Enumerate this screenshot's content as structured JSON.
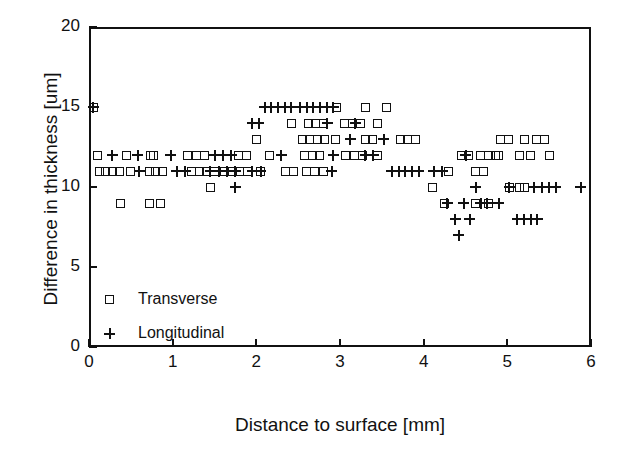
{
  "chart_data": {
    "type": "scatter",
    "title": "",
    "xlabel": "Distance to surface [mm]",
    "ylabel": "Difference in thickness [um]",
    "xlim": [
      0,
      6
    ],
    "ylim": [
      0,
      20
    ],
    "xticks": [
      0,
      1,
      2,
      3,
      4,
      5,
      6
    ],
    "yticks": [
      0,
      5,
      10,
      15,
      20
    ],
    "xtick_labels": [
      "0",
      "1",
      "2",
      "3",
      "4",
      "5",
      "6"
    ],
    "ytick_labels": [
      "0",
      "5",
      "10",
      "15",
      "20"
    ],
    "grid": false,
    "legend_position": "inside lower-left",
    "series": [
      {
        "name": "Transverse",
        "marker": "square",
        "color": "#111111",
        "points": [
          [
            0.05,
            15
          ],
          [
            0.1,
            12
          ],
          [
            0.45,
            12
          ],
          [
            0.73,
            12
          ],
          [
            0.77,
            12
          ],
          [
            1.18,
            12
          ],
          [
            1.28,
            12
          ],
          [
            1.38,
            12
          ],
          [
            1.79,
            12
          ],
          [
            1.88,
            12
          ],
          [
            2.16,
            12
          ],
          [
            2.57,
            12
          ],
          [
            2.67,
            12
          ],
          [
            2.76,
            12
          ],
          [
            3.07,
            12
          ],
          [
            3.17,
            12
          ],
          [
            3.27,
            12
          ],
          [
            3.45,
            12
          ],
          [
            0.12,
            11
          ],
          [
            0.2,
            11
          ],
          [
            0.28,
            11
          ],
          [
            0.36,
            11
          ],
          [
            0.5,
            11
          ],
          [
            0.72,
            11
          ],
          [
            0.8,
            11
          ],
          [
            0.88,
            11
          ],
          [
            1.23,
            11
          ],
          [
            1.32,
            11
          ],
          [
            1.41,
            11
          ],
          [
            1.5,
            11
          ],
          [
            1.62,
            11
          ],
          [
            1.71,
            11
          ],
          [
            1.8,
            11
          ],
          [
            1.89,
            11
          ],
          [
            2.05,
            11
          ],
          [
            2.35,
            11
          ],
          [
            2.44,
            11
          ],
          [
            2.6,
            11
          ],
          [
            2.7,
            11
          ],
          [
            2.8,
            11
          ],
          [
            1.45,
            10
          ],
          [
            0.38,
            9
          ],
          [
            0.72,
            9
          ],
          [
            0.85,
            9
          ],
          [
            2.96,
            15
          ],
          [
            3.3,
            15
          ],
          [
            3.55,
            15
          ],
          [
            2.42,
            14
          ],
          [
            2.62,
            14
          ],
          [
            2.71,
            14
          ],
          [
            2.8,
            14
          ],
          [
            3.05,
            14
          ],
          [
            3.15,
            14
          ],
          [
            3.24,
            14
          ],
          [
            3.45,
            14
          ],
          [
            2.0,
            13
          ],
          [
            2.55,
            13
          ],
          [
            2.64,
            13
          ],
          [
            2.73,
            13
          ],
          [
            2.82,
            13
          ],
          [
            2.95,
            13
          ],
          [
            3.3,
            13
          ],
          [
            3.39,
            13
          ],
          [
            3.72,
            13
          ],
          [
            3.81,
            13
          ],
          [
            3.9,
            13
          ],
          [
            4.45,
            12
          ],
          [
            4.54,
            12
          ],
          [
            4.68,
            12
          ],
          [
            4.77,
            12
          ],
          [
            4.86,
            12
          ],
          [
            4.92,
            13
          ],
          [
            5.01,
            13
          ],
          [
            5.2,
            13
          ],
          [
            5.35,
            13
          ],
          [
            5.44,
            13
          ],
          [
            4.9,
            12
          ],
          [
            5.15,
            12
          ],
          [
            5.28,
            12
          ],
          [
            5.5,
            12
          ],
          [
            4.3,
            11
          ],
          [
            4.62,
            11
          ],
          [
            4.71,
            11
          ],
          [
            4.25,
            9
          ],
          [
            4.62,
            9
          ],
          [
            4.78,
            9
          ],
          [
            5.02,
            10
          ],
          [
            5.14,
            10
          ],
          [
            5.2,
            10
          ],
          [
            4.1,
            10
          ]
        ]
      },
      {
        "name": "Longitudinal",
        "marker": "plus",
        "color": "#111111",
        "points": [
          [
            0.05,
            15
          ],
          [
            0.28,
            12
          ],
          [
            0.58,
            12
          ],
          [
            0.98,
            12
          ],
          [
            1.5,
            12
          ],
          [
            1.6,
            12
          ],
          [
            1.7,
            12
          ],
          [
            2.3,
            12
          ],
          [
            2.92,
            12
          ],
          [
            0.6,
            11
          ],
          [
            1.05,
            11
          ],
          [
            1.15,
            11
          ],
          [
            1.45,
            11
          ],
          [
            1.55,
            11
          ],
          [
            1.65,
            11
          ],
          [
            1.75,
            11
          ],
          [
            1.95,
            11
          ],
          [
            2.05,
            11
          ],
          [
            2.9,
            11
          ],
          [
            1.75,
            10
          ],
          [
            2.1,
            15
          ],
          [
            2.18,
            15
          ],
          [
            2.26,
            15
          ],
          [
            2.34,
            15
          ],
          [
            2.42,
            15
          ],
          [
            2.52,
            15
          ],
          [
            2.6,
            15
          ],
          [
            2.68,
            15
          ],
          [
            2.76,
            15
          ],
          [
            2.84,
            15
          ],
          [
            2.92,
            15
          ],
          [
            1.95,
            14
          ],
          [
            2.03,
            14
          ],
          [
            2.85,
            14
          ],
          [
            3.18,
            14
          ],
          [
            3.12,
            13
          ],
          [
            3.52,
            13
          ],
          [
            3.3,
            12
          ],
          [
            3.4,
            12
          ],
          [
            3.62,
            11
          ],
          [
            3.7,
            11
          ],
          [
            3.78,
            11
          ],
          [
            3.86,
            11
          ],
          [
            3.94,
            11
          ],
          [
            4.12,
            11
          ],
          [
            4.22,
            11
          ],
          [
            4.5,
            12
          ],
          [
            4.62,
            10
          ],
          [
            5.02,
            10
          ],
          [
            5.32,
            10
          ],
          [
            5.42,
            10
          ],
          [
            5.5,
            10
          ],
          [
            5.58,
            10
          ],
          [
            5.88,
            10
          ],
          [
            4.28,
            9
          ],
          [
            4.48,
            9
          ],
          [
            4.68,
            9
          ],
          [
            4.76,
            9
          ],
          [
            4.9,
            9
          ],
          [
            4.38,
            8
          ],
          [
            4.55,
            8
          ],
          [
            5.12,
            8
          ],
          [
            5.2,
            8
          ],
          [
            5.28,
            8
          ],
          [
            5.36,
            8
          ],
          [
            4.42,
            7
          ]
        ]
      }
    ]
  },
  "legend": {
    "items": [
      {
        "label": "Transverse",
        "marker": "square"
      },
      {
        "label": "Longitudinal",
        "marker": "plus"
      }
    ]
  }
}
